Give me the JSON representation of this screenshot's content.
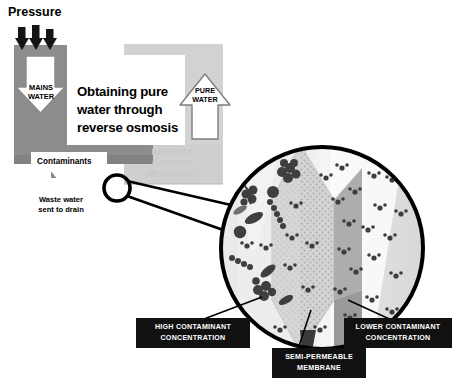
{
  "diagram": {
    "title": "Obtaining pure\nwater through\nreverse osmosis",
    "title_lines": [
      "Obtaining pure",
      "water through",
      "reverse osmosis"
    ],
    "pressure_label": "Pressure",
    "mains_water_line1": "MAINS",
    "mains_water_line2": "WATER",
    "pure_water_line1": "PURE",
    "pure_water_line2": "WATER",
    "contaminants_label": "Contaminants",
    "waste_line1": "Waste water",
    "waste_line2": "sent to drain",
    "watermark_line1": "REVERSE",
    "watermark_line2": "OSMOSIS",
    "watermark_line3": "MEMBRANE"
  },
  "callouts": {
    "high_concentration_line1": "HIGH CONTAMINANT",
    "high_concentration_line2": "CONCENTRATION",
    "membrane_line1": "SEMI-PERMEABLE",
    "membrane_line2": "MEMBRANE",
    "low_concentration_line1": "LOWER CONTAMINANT",
    "low_concentration_line2": "CONCENTRATION"
  },
  "colors": {
    "background": "#ffffff",
    "pipe_dark_grey": "#8c8c8c",
    "pipe_light_grey": "#d9d9d9",
    "housing_grey": "#cfcfcf",
    "arrow_fill": "#ffffff",
    "arrow_stroke": "#595959",
    "pressure_arrow": "#1a1a1a",
    "callout_bg": "#111111",
    "callout_text": "#ffffff",
    "circle_stroke": "#000000",
    "circle_left_fill": "#e8e8e8",
    "circle_right_fill": "#dddddd",
    "membrane_fill": "#cccccc",
    "membrane_edge": "#9a9a9a",
    "contaminant": "#3a3a3a",
    "water_molecule": "#4a4a4a",
    "watermark_text": "#c9c9c9"
  },
  "detail_circle": {
    "center_x": 322,
    "center_y": 248,
    "radius": 104,
    "stroke_width": 4
  },
  "magnifier": {
    "center_x": 117,
    "center_y": 188,
    "radius": 13,
    "stroke_width": 3.4
  }
}
